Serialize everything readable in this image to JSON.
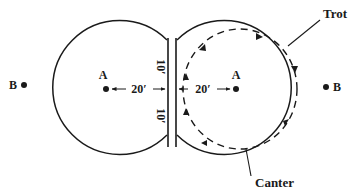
{
  "diagram": {
    "type": "riding-arena-circle-figure",
    "colors": {
      "stroke": "#1a1a1a",
      "background": "#ffffff"
    },
    "left_circle": {
      "center_label": "A",
      "outside_label": "B",
      "radius_label": "20′",
      "upper_wall_label": "10′",
      "lower_wall_label": "10′"
    },
    "right_circle": {
      "center_label": "A",
      "outside_label": "B",
      "radius_label": "20′",
      "path_style": "dashed-with-arrows",
      "direction": "clockwise"
    },
    "callouts": {
      "trot": "Trot",
      "canter": "Canter"
    }
  }
}
